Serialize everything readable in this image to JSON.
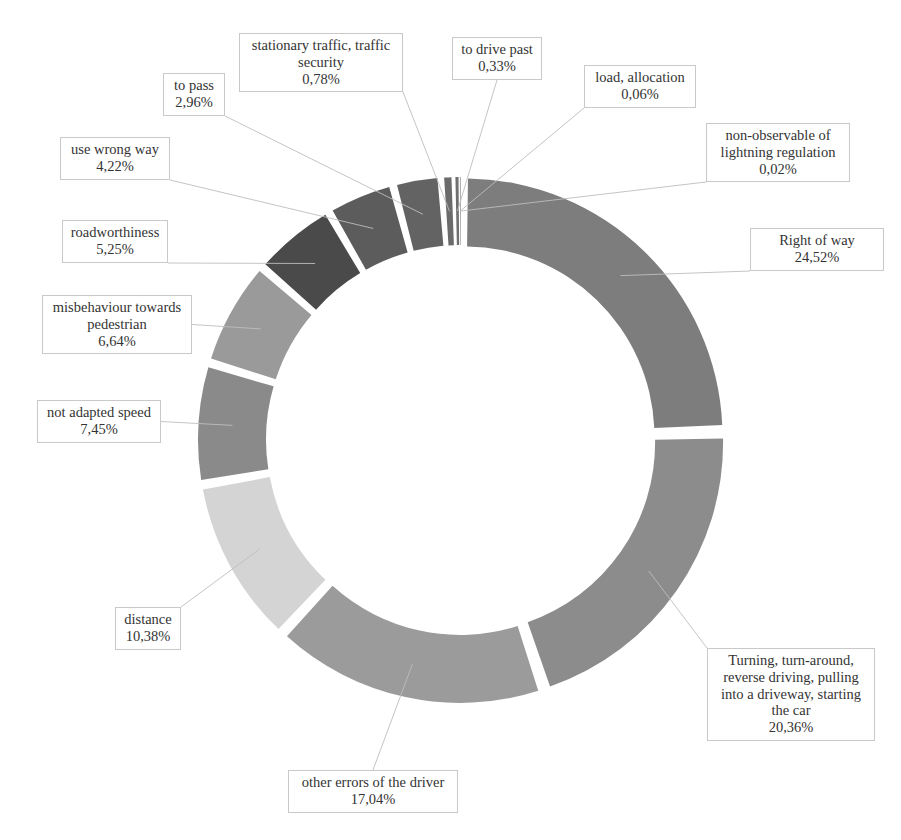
{
  "figure": {
    "clipped_top_caption": "",
    "background_color": "#ffffff",
    "border_color": "#c9c9c9",
    "text_color": "#333333"
  },
  "chart_data": {
    "type": "pie",
    "variant": "doughnut-exploded",
    "title": "",
    "subtitle": "",
    "xlabel": "",
    "ylabel": "",
    "legend": "none",
    "grid": false,
    "units": "percent",
    "decimal_separator": ",",
    "start_angle_deg": 0,
    "direction": "clockwise",
    "center": [
      461,
      440
    ],
    "outer_radius": 258,
    "inner_radius": 190,
    "categories": [
      "Right of way",
      "Turning, turn-around, reverse driving, pulling into a driveway, starting the car",
      "other errors of the driver",
      "distance",
      "not adapted speed",
      "misbehaviour towards pedestrian",
      "roadworthiness",
      "use wrong way",
      "to pass",
      "stationary traffic, traffic security",
      "to drive past",
      "load, allocation",
      "non-observable of lightning regulation"
    ],
    "values": [
      24.52,
      20.36,
      17.04,
      10.38,
      7.45,
      6.64,
      5.25,
      4.22,
      2.96,
      0.78,
      0.33,
      0.06,
      0.02
    ],
    "value_labels": [
      "24,52%",
      "20,36%",
      "17,04%",
      "10,38%",
      "7,45%",
      "6,64%",
      "5,25%",
      "4,22%",
      "2,96%",
      "0,78%",
      "0,33%",
      "0,06%",
      "0,02%"
    ],
    "colors": [
      "#7d7d7d",
      "#8c8c8c",
      "#9b9b9b",
      "#d4d4d4",
      "#8a8a8a",
      "#9a9a9a",
      "#4a4a4a",
      "#5c5c5c",
      "#636363",
      "#6b6b6b",
      "#6f6f6f",
      "#757575",
      "#7a7a7a"
    ]
  },
  "slices": [
    {
      "id": "right-of-way",
      "label": "Right of way",
      "percent": "24,52%",
      "value": 24.52,
      "color": "#7d7d7d",
      "callout": {
        "left": 750,
        "top": 228,
        "width": 134
      }
    },
    {
      "id": "turning",
      "label": "Turning, turn-around,\nreverse driving, pulling\ninto a driveway, starting\nthe car",
      "percent": "20,36%",
      "value": 20.36,
      "color": "#8c8c8c",
      "callout": {
        "left": 707,
        "top": 648,
        "width": 168
      }
    },
    {
      "id": "other-errors",
      "label": "other errors of the driver",
      "percent": "17,04%",
      "value": 17.04,
      "color": "#9b9b9b",
      "callout": {
        "left": 288,
        "top": 770,
        "width": 170
      }
    },
    {
      "id": "distance",
      "label": "distance",
      "percent": "10,38%",
      "value": 10.38,
      "color": "#d4d4d4",
      "callout": {
        "left": 115,
        "top": 607,
        "width": 66
      }
    },
    {
      "id": "not-adapted-speed",
      "label": "not adapted speed",
      "percent": "7,45%",
      "value": 7.45,
      "color": "#8a8a8a",
      "callout": {
        "left": 37,
        "top": 400,
        "width": 124
      }
    },
    {
      "id": "misbehaviour-pedestrian",
      "label": "misbehaviour towards\npedestrian",
      "percent": "6,64%",
      "value": 6.64,
      "color": "#9a9a9a",
      "callout": {
        "left": 42,
        "top": 295,
        "width": 150
      }
    },
    {
      "id": "roadworthiness",
      "label": "roadworthiness",
      "percent": "5,25%",
      "value": 5.25,
      "color": "#4a4a4a",
      "callout": {
        "left": 62,
        "top": 220,
        "width": 106
      }
    },
    {
      "id": "use-wrong-way",
      "label": "use wrong way",
      "percent": "4,22%",
      "value": 4.22,
      "color": "#5c5c5c",
      "callout": {
        "left": 60,
        "top": 137,
        "width": 110
      }
    },
    {
      "id": "to-pass",
      "label": "to pass",
      "percent": "2,96%",
      "value": 2.96,
      "color": "#636363",
      "callout": {
        "left": 163,
        "top": 73,
        "width": 62
      }
    },
    {
      "id": "stationary-traffic",
      "label": "stationary traffic, traffic\nsecurity",
      "percent": "0,78%",
      "value": 0.78,
      "color": "#6b6b6b",
      "callout": {
        "left": 239,
        "top": 33,
        "width": 164
      }
    },
    {
      "id": "to-drive-past",
      "label": "to drive past",
      "percent": "0,33%",
      "value": 0.33,
      "color": "#6f6f6f",
      "callout": {
        "left": 452,
        "top": 37,
        "width": 90
      }
    },
    {
      "id": "load-allocation",
      "label": "load, allocation",
      "percent": "0,06%",
      "value": 0.06,
      "color": "#757575",
      "callout": {
        "left": 584,
        "top": 65,
        "width": 112
      }
    },
    {
      "id": "non-observable-lightning",
      "label": "non-observable of\nlightning regulation",
      "percent": "0,02%",
      "value": 0.02,
      "color": "#7a7a7a",
      "callout": {
        "left": 706,
        "top": 123,
        "width": 144
      }
    }
  ]
}
